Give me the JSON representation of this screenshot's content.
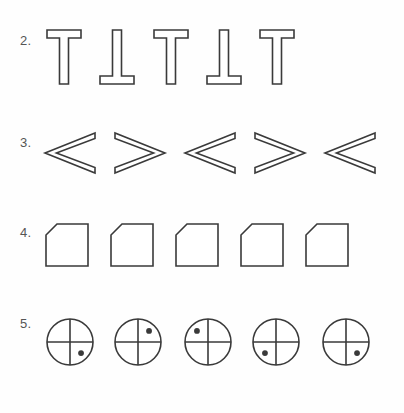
{
  "page": {
    "background_color": "#fefefe",
    "stroke_color": "#3a3a3a",
    "label_color": "#555555",
    "fill_color": "#ffffff"
  },
  "rows": [
    {
      "id": "row-2",
      "label": "2.",
      "shape_name": "t-shape",
      "description": "Outlined T shapes alternating upright and inverted",
      "items": [
        {
          "index": 1,
          "orientation": "upright",
          "rotation_deg": 0
        },
        {
          "index": 2,
          "orientation": "inverted",
          "rotation_deg": 180
        },
        {
          "index": 3,
          "orientation": "upright",
          "rotation_deg": 0
        },
        {
          "index": 4,
          "orientation": "inverted",
          "rotation_deg": 180
        },
        {
          "index": 5,
          "orientation": "upright",
          "rotation_deg": 0
        }
      ]
    },
    {
      "id": "row-3",
      "label": "3.",
      "shape_name": "chevron-arrow",
      "description": "Outlined hollow arrowhead chevrons alternating pointing left and right",
      "items": [
        {
          "index": 1,
          "orientation": "points-left",
          "rotation_deg": 0
        },
        {
          "index": 2,
          "orientation": "points-right",
          "rotation_deg": 180
        },
        {
          "index": 3,
          "orientation": "points-left",
          "rotation_deg": 0
        },
        {
          "index": 4,
          "orientation": "points-right",
          "rotation_deg": 180
        },
        {
          "index": 5,
          "orientation": "points-left",
          "rotation_deg": 0
        }
      ]
    },
    {
      "id": "row-4",
      "label": "4.",
      "shape_name": "chamfered-square",
      "description": "Squares with the top-left corner cut off, all identical orientation",
      "items": [
        {
          "index": 1,
          "orientation": "corner-top-left",
          "rotation_deg": 0
        },
        {
          "index": 2,
          "orientation": "corner-top-left",
          "rotation_deg": 0
        },
        {
          "index": 3,
          "orientation": "corner-top-left",
          "rotation_deg": 0
        },
        {
          "index": 4,
          "orientation": "corner-top-left",
          "rotation_deg": 0
        },
        {
          "index": 5,
          "orientation": "corner-top-left",
          "rotation_deg": 0
        }
      ]
    },
    {
      "id": "row-5",
      "label": "5.",
      "shape_name": "quartered-circle-with-dot",
      "description": "Circles divided into quadrants by a vertical and horizontal line, each with a single filled dot in one quadrant",
      "items": [
        {
          "index": 1,
          "dot_quadrant": "bottom-right"
        },
        {
          "index": 2,
          "dot_quadrant": "top-right"
        },
        {
          "index": 3,
          "dot_quadrant": "top-left"
        },
        {
          "index": 4,
          "dot_quadrant": "bottom-left"
        },
        {
          "index": 5,
          "dot_quadrant": "bottom-right"
        }
      ]
    }
  ],
  "layout": {
    "row2_x": [
      45,
      98,
      152,
      205,
      258
    ],
    "row3_x": [
      42,
      112,
      182,
      252,
      322
    ],
    "row4_x": [
      44,
      109,
      174,
      239,
      304
    ],
    "row5_x": [
      44,
      112,
      182,
      250,
      320
    ]
  }
}
